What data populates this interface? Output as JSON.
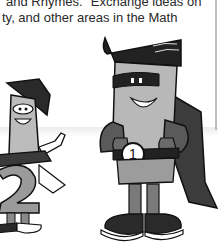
{
  "document": {
    "text_lines": [
      "and Rhymes.\" Exchange ideas on",
      "ty, and other areas in the Math"
    ]
  },
  "illustrations": {
    "left_character": {
      "label": "2",
      "description": "cartoon number 2 character with graduation cap waving"
    },
    "right_character": {
      "label": "1",
      "description": "cartoon number 1 superhero character with mask and cape"
    }
  },
  "colors": {
    "ink": "#1a1a1a",
    "mid_gray": "#8a8a8a",
    "light_gray": "#c9c9c9",
    "dark_gray": "#4a4a4a"
  }
}
